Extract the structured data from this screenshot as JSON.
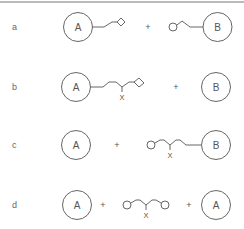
{
  "rows": [
    {
      "label": "a",
      "left_molecule": "A",
      "operator": "+",
      "right_molecule": "B",
      "description": "A with linker ending in diamond + circle-ended linker attached to B"
    },
    {
      "label": "b",
      "left_molecule": "A",
      "branch_label": "X",
      "operator": "+",
      "right_molecule": "B",
      "description": "A with branched linker (X) ending in diamond + B"
    },
    {
      "label": "c",
      "left_molecule": "A",
      "operator": "+",
      "branch_label": "X",
      "right_molecule": "B",
      "description": "A + circle-ended branched linker (X) attached to B"
    },
    {
      "label": "d",
      "left_molecule": "A",
      "operator1": "+",
      "branch_label": "X",
      "operator2": "+",
      "right_molecule": "A",
      "description": "A + bifunctional linker with two circle ends and branch X + A"
    }
  ],
  "colors": {
    "line": "#555555",
    "background": "#ffffff",
    "border": "#777777"
  }
}
